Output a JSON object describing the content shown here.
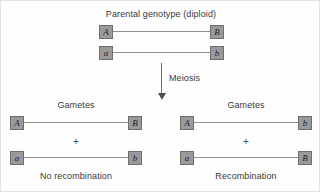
{
  "figure": {
    "title": "Parental genotype (diploid)",
    "process_label": "Meiosis",
    "plus_symbol": "+"
  },
  "parental": {
    "chromosomes": [
      {
        "left_allele": "A",
        "right_allele": "B"
      },
      {
        "left_allele": "a",
        "right_allele": "b"
      }
    ]
  },
  "outcomes": [
    {
      "heading": "Gametes",
      "caption": "No recombination",
      "chromosomes": [
        {
          "left_allele": "A",
          "right_allele": "B"
        },
        {
          "left_allele": "a",
          "right_allele": "b"
        }
      ]
    },
    {
      "heading": "Gametes",
      "caption": "Recombination",
      "chromosomes": [
        {
          "left_allele": "A",
          "right_allele": "b"
        },
        {
          "left_allele": "a",
          "right_allele": "B"
        }
      ]
    }
  ],
  "colors": {
    "allele_box_fill": "#9a9a9a",
    "allele_box_border": "#6e6e6e",
    "chromosome_line": "#8f8f8f",
    "text": "#3a3a3a",
    "arrow": "#4f4f4f",
    "background": "#fefefe"
  }
}
